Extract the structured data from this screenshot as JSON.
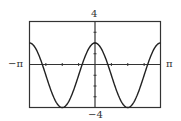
{
  "chart_data": {
    "type": "line",
    "title": "",
    "function": "y = 3cos(2x) - 1",
    "xlabel": "",
    "ylabel": "",
    "xlim": [
      -3.14159,
      3.14159
    ],
    "ylim": [
      -4,
      4
    ],
    "x_tick_labels": {
      "left": "−π",
      "right": "π"
    },
    "y_tick_labels": {
      "top": "4",
      "bottom": "−4"
    },
    "x_ticks_minor_step": 0.785398,
    "y_ticks_minor_step": 1,
    "grid": false,
    "series": [
      {
        "name": "curve",
        "x": [
          -3.1416,
          -2.3562,
          -1.5708,
          -0.7854,
          0,
          0.7854,
          1.5708,
          2.3562,
          3.1416
        ],
        "y": [
          2,
          -1,
          -4,
          -1,
          2,
          -1,
          -4,
          -1,
          2
        ]
      }
    ],
    "colors": {
      "axis": "#333333",
      "curve": "#222222",
      "frame": "#333333"
    }
  },
  "labels": {
    "y_top": "4",
    "y_bottom": "−4",
    "x_left": "−π",
    "x_right": "π"
  }
}
